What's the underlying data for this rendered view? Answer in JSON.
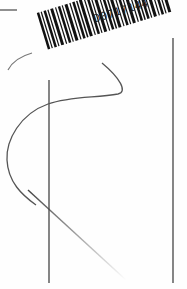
{
  "document": {
    "type": "scanned page",
    "barcode": {
      "label": "D0717144",
      "icon": "barcode-icon"
    },
    "drawings": {
      "top_rule": "short horizontal line",
      "vertical_lines": 2,
      "curve": "s-shaped curve",
      "diagonal": "fading diagonal stroke"
    },
    "colors": {
      "ink": "#333333",
      "paper": "#fefefe"
    }
  }
}
